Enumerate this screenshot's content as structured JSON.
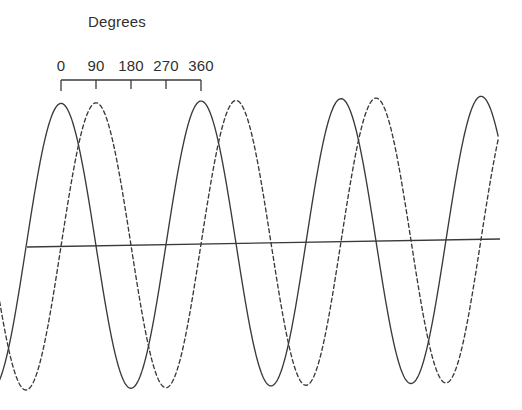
{
  "figure": {
    "width": 522,
    "height": 410,
    "background_color": "#ffffff",
    "stroke_color": "#3a3a3a",
    "text_color": "#2f2f2f"
  },
  "axis": {
    "title": "Degrees",
    "title_x": 117,
    "title_y": 27,
    "tick_labels": [
      "0",
      "90",
      "180",
      "270",
      "360"
    ],
    "tick_positions_px": [
      61,
      96,
      131,
      166,
      201
    ],
    "tick_values_deg": [
      0,
      90,
      180,
      270,
      360
    ],
    "scale_bar_y": 80,
    "scale_bar_x_start": 61,
    "scale_bar_x_end": 201,
    "tick_length": 11,
    "label_baseline_y": 71
  },
  "baseline": {
    "name": "zero-axis",
    "x1": 27,
    "y1": 247,
    "x2": 500,
    "y2": 239,
    "tilted": true
  },
  "chart_data": {
    "type": "line",
    "title": "Degrees",
    "xlabel": "Degrees",
    "ylabel": "",
    "grid": false,
    "legend": "none",
    "x_unit": "degrees",
    "x_tick_labels": [
      "0",
      "90",
      "180",
      "270",
      "360"
    ],
    "x_ticks": [
      0,
      90,
      180,
      270,
      360
    ],
    "xlim": [
      -175,
      1125
    ],
    "ylim": [
      -1.05,
      1.05
    ],
    "period_deg": 360,
    "period_px": 140,
    "amplitude_px": 143,
    "pixels_per_degree": 0.3889,
    "x_at_zero_deg_px": 61,
    "series": [
      {
        "name": "solid-sine",
        "style": "solid",
        "phase_deg": 90,
        "description": "cosine-like wave peaking at 0, 360, 720 degrees",
        "peaks_deg": [
          0,
          360,
          720
        ],
        "peaks_px_x": [
          61,
          201,
          341
        ],
        "peaks_px_y": [
          104,
          104,
          104
        ],
        "troughs_deg": [
          180,
          540,
          900
        ],
        "troughs_px_x": [
          131,
          271,
          411
        ],
        "troughs_px_y": [
          391,
          390,
          389
        ],
        "zero_crossings_deg": [
          -90,
          90,
          270,
          450,
          630,
          810,
          990
        ],
        "values_sampled": [
          {
            "deg": -90,
            "y": 0.0
          },
          {
            "deg": -45,
            "y": 0.707
          },
          {
            "deg": 0,
            "y": 1.0
          },
          {
            "deg": 45,
            "y": 0.707
          },
          {
            "deg": 90,
            "y": 0.0
          },
          {
            "deg": 135,
            "y": -0.707
          },
          {
            "deg": 180,
            "y": -1.0
          },
          {
            "deg": 225,
            "y": -0.707
          },
          {
            "deg": 270,
            "y": 0.0
          },
          {
            "deg": 315,
            "y": 0.707
          },
          {
            "deg": 360,
            "y": 1.0
          },
          {
            "deg": 405,
            "y": 0.707
          },
          {
            "deg": 450,
            "y": 0.0
          },
          {
            "deg": 495,
            "y": -0.707
          },
          {
            "deg": 540,
            "y": -1.0
          },
          {
            "deg": 585,
            "y": -0.707
          },
          {
            "deg": 630,
            "y": 0.0
          },
          {
            "deg": 675,
            "y": 0.707
          },
          {
            "deg": 720,
            "y": 1.0
          },
          {
            "deg": 765,
            "y": 0.707
          },
          {
            "deg": 810,
            "y": 0.0
          },
          {
            "deg": 855,
            "y": -0.707
          },
          {
            "deg": 900,
            "y": -1.0
          },
          {
            "deg": 945,
            "y": -0.707
          },
          {
            "deg": 990,
            "y": 0.0
          }
        ]
      },
      {
        "name": "dashed-sine",
        "style": "dashed",
        "dash_pattern": "4 3",
        "phase_deg": 0,
        "phase_lag_deg": 90,
        "description": "sine wave lagging the solid wave by 90 degrees",
        "peaks_deg": [
          90,
          450,
          810
        ],
        "peaks_px_x": [
          96,
          236,
          376
        ],
        "peaks_px_y": [
          104,
          104,
          104
        ],
        "troughs_deg": [
          270,
          630,
          990
        ],
        "troughs_px_x": [
          166,
          306,
          446
        ],
        "troughs_px_y": [
          391,
          390,
          389
        ],
        "zero_crossings_deg": [
          0,
          180,
          360,
          540,
          720,
          900,
          1080
        ],
        "values_sampled": [
          {
            "deg": -90,
            "y": -1.0
          },
          {
            "deg": -45,
            "y": -0.707
          },
          {
            "deg": 0,
            "y": 0.0
          },
          {
            "deg": 45,
            "y": 0.707
          },
          {
            "deg": 90,
            "y": 1.0
          },
          {
            "deg": 135,
            "y": 0.707
          },
          {
            "deg": 180,
            "y": 0.0
          },
          {
            "deg": 225,
            "y": -0.707
          },
          {
            "deg": 270,
            "y": -1.0
          },
          {
            "deg": 315,
            "y": -0.707
          },
          {
            "deg": 360,
            "y": 0.0
          },
          {
            "deg": 405,
            "y": 0.707
          },
          {
            "deg": 450,
            "y": 1.0
          },
          {
            "deg": 495,
            "y": 0.707
          },
          {
            "deg": 540,
            "y": 0.0
          },
          {
            "deg": 585,
            "y": -0.707
          },
          {
            "deg": 630,
            "y": -1.0
          },
          {
            "deg": 675,
            "y": -0.707
          },
          {
            "deg": 720,
            "y": 0.0
          },
          {
            "deg": 765,
            "y": 0.707
          },
          {
            "deg": 810,
            "y": 1.0
          },
          {
            "deg": 855,
            "y": 0.707
          },
          {
            "deg": 900,
            "y": 0.0
          },
          {
            "deg": 945,
            "y": -0.707
          },
          {
            "deg": 990,
            "y": -1.0
          },
          {
            "deg": 1035,
            "y": -0.707
          },
          {
            "deg": 1080,
            "y": 0.0
          }
        ]
      }
    ]
  }
}
